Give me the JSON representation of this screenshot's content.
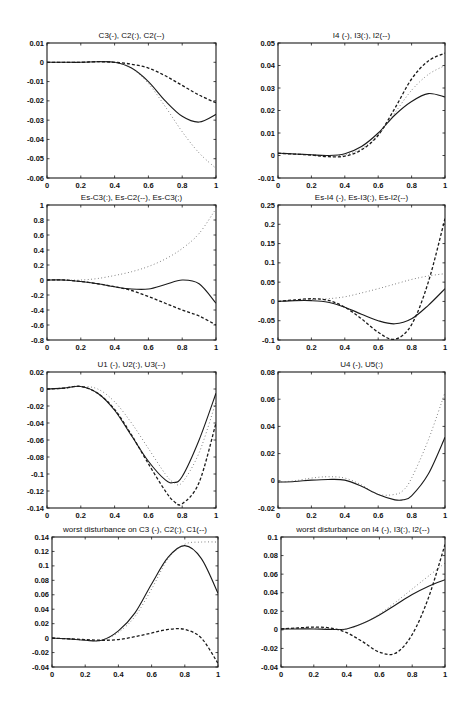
{
  "figure": {
    "background": "#ffffff",
    "ink_color": "#1a1a1a",
    "dotted_color": "#555555"
  },
  "chart_data": [
    {
      "id": "p1",
      "type": "line",
      "title": "C3(-), C2(:), C2(--)",
      "xlabel": "",
      "ylabel": "",
      "xlim": [
        0,
        1
      ],
      "ylim": [
        -0.06,
        0.01
      ],
      "xticks": [
        0,
        0.2,
        0.4,
        0.6,
        0.8,
        1
      ],
      "xtick_labels": [
        "0",
        "0.2",
        "0.4",
        "0.6",
        "0.8",
        "1"
      ],
      "yticks": [
        0.01,
        0,
        -0.01,
        -0.02,
        -0.03,
        -0.04,
        -0.05,
        -0.06
      ],
      "ytick_labels": [
        "0.01",
        "0",
        "-0.01",
        "-0.02",
        "-0.03",
        "-0.04",
        "-0.05",
        "-0.06"
      ],
      "grid": false,
      "box": [
        47,
        43,
        169,
        135
      ],
      "x": [
        0,
        0.1,
        0.2,
        0.3,
        0.4,
        0.5,
        0.6,
        0.7,
        0.8,
        0.9,
        1.0
      ],
      "series": [
        {
          "name": "C3",
          "style": "solid",
          "values": [
            0,
            0,
            0,
            0.0003,
            0,
            -0.003,
            -0.01,
            -0.02,
            -0.028,
            -0.031,
            -0.027
          ]
        },
        {
          "name": "C2 (dotted)",
          "style": "dotted",
          "values": [
            0,
            0,
            0,
            0.0003,
            0,
            -0.003,
            -0.011,
            -0.023,
            -0.036,
            -0.047,
            -0.055
          ]
        },
        {
          "name": "C2 (dashed)",
          "style": "dashed",
          "values": [
            0,
            0,
            0,
            0.0003,
            0,
            -0.001,
            -0.003,
            -0.007,
            -0.012,
            -0.017,
            -0.021
          ]
        }
      ]
    },
    {
      "id": "p2",
      "type": "line",
      "title": "I4 (-), I3(:), I2(--)",
      "xlabel": "",
      "ylabel": "",
      "xlim": [
        0,
        1
      ],
      "ylim": [
        -0.01,
        0.05
      ],
      "xticks": [
        0,
        0.2,
        0.4,
        0.6,
        0.8,
        1
      ],
      "xtick_labels": [
        "0",
        "0.2",
        "0.4",
        "0.6",
        "0.8",
        "1"
      ],
      "yticks": [
        0.05,
        0.04,
        0.03,
        0.02,
        0.01,
        0,
        -0.01
      ],
      "ytick_labels": [
        "0.05",
        "0.04",
        "0.03",
        "0.02",
        "0.01",
        "0",
        "-0.01"
      ],
      "grid": false,
      "box": [
        278,
        43,
        167,
        135
      ],
      "x": [
        0,
        0.1,
        0.2,
        0.3,
        0.4,
        0.5,
        0.6,
        0.7,
        0.8,
        0.9,
        1.0
      ],
      "series": [
        {
          "name": "I4",
          "style": "solid",
          "values": [
            0.001,
            0.0007,
            0.0003,
            0,
            0.0008,
            0.004,
            0.01,
            0.018,
            0.024,
            0.0275,
            0.026
          ]
        },
        {
          "name": "I3",
          "style": "dotted",
          "values": [
            0.001,
            0.0007,
            0.0003,
            -0.0002,
            0.0003,
            0.003,
            0.009,
            0.019,
            0.029,
            0.036,
            0.04
          ]
        },
        {
          "name": "I2",
          "style": "dashed",
          "values": [
            0.001,
            0.0006,
            0.0002,
            -0.0005,
            -0.0003,
            0.0025,
            0.009,
            0.021,
            0.034,
            0.042,
            0.0455
          ]
        }
      ]
    },
    {
      "id": "p3",
      "type": "line",
      "title": "Es-C3(:),  Es-C2(--), Es-C3(;)",
      "xlabel": "",
      "ylabel": "",
      "xlim": [
        0,
        1
      ],
      "ylim": [
        -0.8,
        1
      ],
      "xticks": [
        0,
        0.2,
        0.4,
        0.6,
        0.8,
        1
      ],
      "xtick_labels": [
        "0",
        "0.2",
        "0.4",
        "0.6",
        "0.8",
        "1"
      ],
      "yticks": [
        1,
        0.8,
        0.6,
        0.4,
        0.2,
        0,
        -0.2,
        -0.4,
        -0.6,
        -0.8
      ],
      "ytick_labels": [
        "1",
        "0.8",
        "0.6",
        "0.4",
        "0.2",
        "0",
        "-0.2",
        "-0.4",
        "-0.6",
        "-0.8"
      ],
      "grid": false,
      "box": [
        47,
        205,
        169,
        135
      ],
      "x": [
        0,
        0.1,
        0.2,
        0.3,
        0.4,
        0.5,
        0.6,
        0.7,
        0.8,
        0.9,
        1.0
      ],
      "series": [
        {
          "name": "solid",
          "style": "solid",
          "values": [
            0,
            0,
            -0.02,
            -0.05,
            -0.09,
            -0.12,
            -0.12,
            -0.06,
            0,
            -0.05,
            -0.31
          ]
        },
        {
          "name": "dotted",
          "style": "dotted",
          "values": [
            0,
            0,
            0,
            0.02,
            0.06,
            0.11,
            0.18,
            0.28,
            0.42,
            0.62,
            0.95
          ]
        },
        {
          "name": "dashed",
          "style": "dashed",
          "values": [
            0,
            0,
            -0.02,
            -0.05,
            -0.09,
            -0.14,
            -0.22,
            -0.31,
            -0.4,
            -0.48,
            -0.6
          ]
        }
      ]
    },
    {
      "id": "p4",
      "type": "line",
      "title": "Es-I4 (-), Es-I3(:), Es-I2(--)",
      "xlabel": "",
      "ylabel": "",
      "xlim": [
        0,
        1
      ],
      "ylim": [
        -0.1,
        0.25
      ],
      "xticks": [
        0,
        0.2,
        0.4,
        0.6,
        0.8,
        1
      ],
      "xtick_labels": [
        "0",
        "0.2",
        "0.4",
        "0.6",
        "0.8",
        "1"
      ],
      "yticks": [
        0.25,
        0.2,
        0.15,
        0.1,
        0.05,
        0,
        -0.05,
        -0.1
      ],
      "ytick_labels": [
        "0.25",
        "0.2",
        "0.15",
        "0.1",
        "0.05",
        "0",
        "-0.05",
        "-0.1"
      ],
      "grid": false,
      "box": [
        278,
        205,
        167,
        135
      ],
      "x": [
        0,
        0.1,
        0.2,
        0.3,
        0.4,
        0.5,
        0.6,
        0.7,
        0.8,
        0.9,
        1.0
      ],
      "series": [
        {
          "name": "Es-I4",
          "style": "solid",
          "values": [
            0,
            0.002,
            0.002,
            -0.002,
            -0.015,
            -0.033,
            -0.05,
            -0.058,
            -0.045,
            -0.01,
            0.033
          ]
        },
        {
          "name": "Es-I3",
          "style": "dotted",
          "values": [
            0,
            0.003,
            0.005,
            0.007,
            0.012,
            0.022,
            0.033,
            0.045,
            0.057,
            0.066,
            0.072
          ]
        },
        {
          "name": "Es-I2",
          "style": "dashed",
          "values": [
            0,
            0.004,
            0.007,
            0.003,
            -0.015,
            -0.045,
            -0.08,
            -0.098,
            -0.06,
            0.05,
            0.215
          ]
        }
      ]
    },
    {
      "id": "p5",
      "type": "line",
      "title": "U1 (-), U2(:), U3(--)",
      "xlabel": "",
      "ylabel": "",
      "xlim": [
        0,
        1
      ],
      "ylim": [
        -0.14,
        0.02
      ],
      "xticks": [
        0,
        0.2,
        0.4,
        0.6,
        0.8,
        1
      ],
      "xtick_labels": [
        "0",
        "0.2",
        "0.4",
        "0.6",
        "0.8",
        "1"
      ],
      "yticks": [
        0.02,
        0,
        -0.02,
        -0.04,
        -0.06,
        -0.08,
        -0.1,
        -0.12,
        -0.14
      ],
      "ytick_labels": [
        "0.02",
        "0",
        "-0.02",
        "-0.04",
        "-0.06",
        "-0.08",
        "-0.1",
        "-0.12",
        "-0.14"
      ],
      "grid": false,
      "box": [
        47,
        372,
        169,
        136
      ],
      "x": [
        0,
        0.1,
        0.2,
        0.3,
        0.4,
        0.5,
        0.6,
        0.7,
        0.75,
        0.8,
        0.9,
        1.0
      ],
      "series": [
        {
          "name": "U1",
          "style": "solid",
          "values": [
            0,
            0.001,
            0.003,
            -0.005,
            -0.025,
            -0.055,
            -0.085,
            -0.107,
            -0.11,
            -0.103,
            -0.06,
            -0.005
          ]
        },
        {
          "name": "U2",
          "style": "dotted",
          "values": [
            0,
            0.001,
            0.003,
            0,
            -0.015,
            -0.04,
            -0.07,
            -0.1,
            -0.11,
            -0.11,
            -0.075,
            -0.015
          ]
        },
        {
          "name": "U3",
          "style": "dashed",
          "values": [
            0,
            0.001,
            0.003,
            -0.005,
            -0.024,
            -0.054,
            -0.088,
            -0.12,
            -0.132,
            -0.135,
            -0.11,
            -0.04
          ]
        }
      ]
    },
    {
      "id": "p6",
      "type": "line",
      "title": "U4 (-), U5(:)",
      "xlabel": "",
      "ylabel": "",
      "xlim": [
        0,
        1
      ],
      "ylim": [
        -0.02,
        0.08
      ],
      "xticks": [
        0,
        0.2,
        0.4,
        0.6,
        0.8,
        1
      ],
      "xtick_labels": [
        "0",
        "0.2",
        "0.4",
        "0.6",
        "0.8",
        "1"
      ],
      "yticks": [
        0.08,
        0.06,
        0.04,
        0.02,
        0,
        -0.02
      ],
      "ytick_labels": [
        "0.08",
        "0.06",
        "0.04",
        "0.02",
        "0",
        "-0.02"
      ],
      "grid": false,
      "box": [
        278,
        372,
        167,
        136
      ],
      "x": [
        0,
        0.1,
        0.2,
        0.3,
        0.4,
        0.5,
        0.6,
        0.7,
        0.75,
        0.8,
        0.9,
        1.0
      ],
      "series": [
        {
          "name": "U4",
          "style": "solid",
          "values": [
            -0.001,
            -0.0005,
            0.0005,
            0.001,
            0.0005,
            -0.004,
            -0.01,
            -0.014,
            -0.014,
            -0.011,
            0.005,
            0.032
          ]
        },
        {
          "name": "U5",
          "style": "dotted",
          "values": [
            -0.001,
            0,
            0.002,
            0.003,
            0.002,
            -0.003,
            -0.01,
            -0.01,
            -0.007,
            0.002,
            0.03,
            0.065
          ]
        }
      ]
    },
    {
      "id": "p7",
      "type": "line",
      "title": "worst disturbance on C3 (-), C2(:), C1(--)",
      "xlabel": "",
      "ylabel": "",
      "xlim": [
        0,
        1
      ],
      "ylim": [
        -0.04,
        0.14
      ],
      "xticks": [
        0,
        0.2,
        0.4,
        0.6,
        0.8,
        1
      ],
      "xtick_labels": [
        "0",
        "0.2",
        "0.4",
        "0.6",
        "0.8",
        "1"
      ],
      "yticks": [
        0.14,
        0.12,
        0.1,
        0.08,
        0.06,
        0.04,
        0.02,
        0,
        -0.02,
        -0.04
      ],
      "ytick_labels": [
        "0.14",
        "0.12",
        "0.1",
        "0.08",
        "0.06",
        "0.04",
        "0.02",
        "0",
        "-0.02",
        "-0.04"
      ],
      "grid": false,
      "box": [
        52,
        537,
        166,
        130
      ],
      "x": [
        0,
        0.1,
        0.2,
        0.3,
        0.4,
        0.5,
        0.6,
        0.7,
        0.8,
        0.9,
        1.0
      ],
      "series": [
        {
          "name": "C3",
          "style": "solid",
          "values": [
            0,
            -0.001,
            -0.003,
            -0.003,
            0.01,
            0.035,
            0.075,
            0.112,
            0.128,
            0.11,
            0.062
          ]
        },
        {
          "name": "C2",
          "style": "dotted",
          "values": [
            0,
            -0.001,
            -0.003,
            -0.003,
            0.008,
            0.03,
            0.068,
            0.11,
            0.13,
            0.133,
            0.133
          ]
        },
        {
          "name": "C1",
          "style": "dashed",
          "values": [
            0,
            -0.001,
            -0.002,
            -0.003,
            -0.002,
            0.002,
            0.007,
            0.012,
            0.012,
            0.0,
            -0.035
          ]
        }
      ]
    },
    {
      "id": "p8",
      "type": "line",
      "title": "worst  disturbance on I4 (-), I3(:), I2(--)",
      "xlabel": "",
      "ylabel": "",
      "xlim": [
        0,
        1
      ],
      "ylim": [
        -0.04,
        0.1
      ],
      "xticks": [
        0,
        0.2,
        0.4,
        0.6,
        0.8,
        1
      ],
      "xtick_labels": [
        "0",
        "0.2",
        "0.4",
        "0.6",
        "0.8",
        "1"
      ],
      "yticks": [
        0.1,
        0.08,
        0.06,
        0.04,
        0.02,
        0,
        -0.02,
        -0.04
      ],
      "ytick_labels": [
        "0.1",
        "0.08",
        "0.06",
        "0.04",
        "0.02",
        "0",
        "-0.02",
        "-0.04"
      ],
      "grid": false,
      "box": [
        281,
        537,
        164,
        130
      ],
      "x": [
        0,
        0.1,
        0.2,
        0.3,
        0.4,
        0.5,
        0.6,
        0.7,
        0.8,
        0.9,
        1.0
      ],
      "series": [
        {
          "name": "I4",
          "style": "solid",
          "values": [
            0.001,
            0.001,
            0.001,
            0.0005,
            0.001,
            0.007,
            0.016,
            0.027,
            0.038,
            0.047,
            0.054
          ]
        },
        {
          "name": "I3",
          "style": "dotted",
          "values": [
            0.001,
            0.002,
            0.002,
            0.001,
            0.001,
            0.007,
            0.017,
            0.03,
            0.044,
            0.058,
            0.072
          ]
        },
        {
          "name": "I2",
          "style": "dashed",
          "values": [
            0.001,
            0.002,
            0.003,
            0.002,
            -0.003,
            -0.013,
            -0.024,
            -0.025,
            -0.005,
            0.035,
            0.092
          ]
        }
      ]
    }
  ]
}
